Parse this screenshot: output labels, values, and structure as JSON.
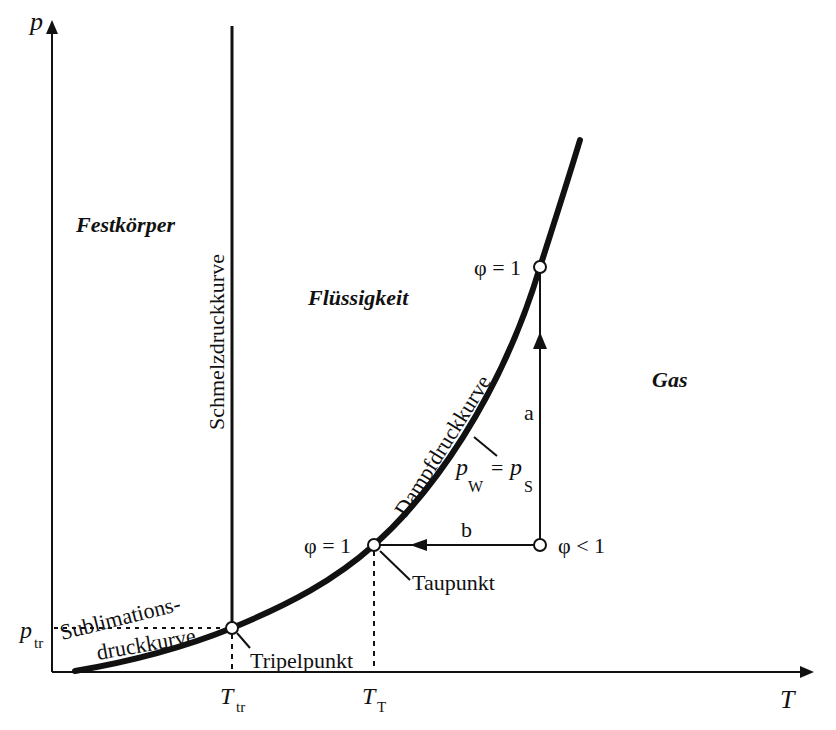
{
  "diagram": {
    "axes": {
      "y_label": "p",
      "x_label": "T",
      "y_tick": {
        "main": "p",
        "sub": "tr"
      },
      "x_ticks": [
        {
          "main": "T",
          "sub": "tr"
        },
        {
          "main": "T",
          "sub": "T"
        }
      ]
    },
    "regions": {
      "solid": "Festkörper",
      "liquid": "Flüssigkeit",
      "gas": "Gas"
    },
    "curves": {
      "melting": "Schmelzdruckkurve",
      "vapor": "Dampfdruckkurve",
      "sublimation_line1": "Sublimations-",
      "sublimation_line2": "druckkurve"
    },
    "points": {
      "triple": "Tripelpunkt",
      "dew": "Taupunkt",
      "phi_eq_1_dew": "φ = 1",
      "phi_eq_1_top": "φ = 1",
      "phi_lt_1": "φ < 1"
    },
    "paths": {
      "a": "a",
      "b": "b"
    },
    "equation": {
      "lhs": "p",
      "lhs_sub": "W",
      "eq": "=",
      "rhs": "p",
      "rhs_sub": "S"
    },
    "colors": {
      "ink": "#111111",
      "background": "#ffffff"
    }
  }
}
